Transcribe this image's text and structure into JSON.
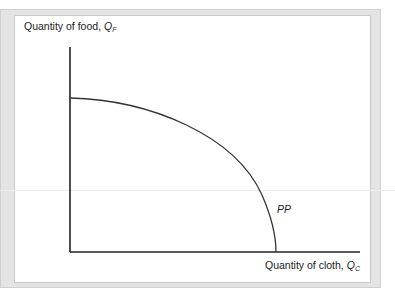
{
  "diagram": {
    "type": "production possibility frontier",
    "y_axis_label": "Quantity of food, ",
    "y_axis_symbol": "Q",
    "y_axis_sub": "F",
    "x_axis_label": "Quantity of cloth, ",
    "x_axis_symbol": "Q",
    "x_axis_sub": "C",
    "curve_label": "PP",
    "colors": {
      "line": "#222222",
      "frame": "#e4e4e4"
    }
  }
}
